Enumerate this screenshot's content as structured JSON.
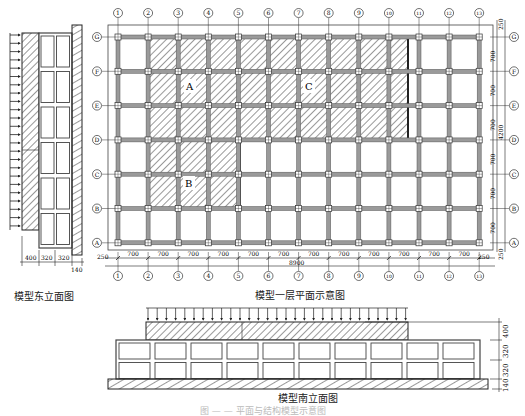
{
  "captions": {
    "east_elevation": "模型东立面图",
    "plan": "模型一层平面示意图",
    "south_elevation": "模型南立面图",
    "figure": "图 — — 平面与结构模型示意图"
  },
  "plan": {
    "column_axes": [
      "1",
      "2",
      "3",
      "4",
      "5",
      "6",
      "7",
      "8",
      "9",
      "10",
      "11",
      "12",
      "13"
    ],
    "row_axes": [
      "G",
      "F",
      "E",
      "D",
      "C",
      "B",
      "A"
    ],
    "bay_width": "700",
    "edge_offset": "250",
    "total_length": "8900",
    "total_width": "4200",
    "regions": [
      {
        "label": "A",
        "cols": [
          2,
          5
        ],
        "rows": [
          "G",
          "D"
        ]
      },
      {
        "label": "C",
        "cols": [
          5,
          9
        ],
        "rows": [
          "G",
          "D"
        ]
      },
      {
        "label": "B",
        "cols": [
          2,
          5
        ],
        "rows": [
          "D",
          "B"
        ]
      }
    ]
  },
  "east_elevation": {
    "dims": [
      "400",
      "320",
      "320",
      "140"
    ]
  },
  "south_elevation": {
    "dims": [
      "400",
      "320",
      "320",
      "140"
    ]
  }
}
